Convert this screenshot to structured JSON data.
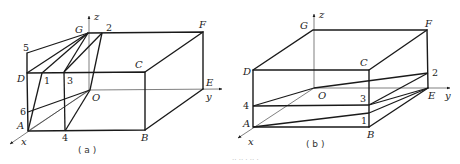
{
  "figure_a": {
    "caption": "( a )",
    "axes": {
      "x": "x",
      "y": "y",
      "z": "z",
      "origin": "O"
    },
    "vertices": {
      "A": "A",
      "B": "B",
      "C": "C",
      "D": "D",
      "E": "E",
      "F": "F",
      "G": "G"
    },
    "points": {
      "p1": "1",
      "p2": "2",
      "p3": "3",
      "p4": "4",
      "p5": "5",
      "p6": "6"
    }
  },
  "figure_b": {
    "caption": "( b )",
    "axes": {
      "x": "x",
      "y": "y",
      "z": "z",
      "origin": "O"
    },
    "vertices": {
      "A": "A",
      "B": "B",
      "C": "C",
      "D": "D",
      "E": "E",
      "F": "F",
      "G": "G"
    },
    "points": {
      "p1": "1",
      "p2": "2",
      "p3": "3",
      "p4": "4"
    }
  },
  "footer_caption": "·· ·· · ·· ·"
}
